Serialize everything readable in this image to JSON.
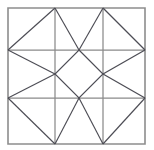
{
  "figure": {
    "name": "quilt-block-geometric-pattern",
    "title": "Ohio Star / Sawtooth quilt block line drawing",
    "background_color": "#ffffff",
    "frame_color": "#8d8d8d",
    "grid_color": "#8a8a8a",
    "diagonal_color": "#4d4d55",
    "canvas": {
      "width": 154,
      "height": 150
    }
  },
  "geometry": {
    "square": {
      "x0": 8,
      "y0": 8,
      "x1": 145,
      "y1": 144
    },
    "vertical_grid_x": [
      55,
      103
    ],
    "horizontal_grid_y": [
      50,
      98
    ],
    "columns": [
      "left",
      "middle",
      "right"
    ],
    "rows": [
      "top",
      "middle",
      "bottom"
    ]
  },
  "chart_data": {
    "type": "diagram",
    "outer_square": {
      "points": "8,8 145,8 145,144 8,144",
      "stroke": "#8d8d8d"
    },
    "grid_lines": [
      {
        "name": "vertical-left",
        "x1": 55,
        "y1": 8,
        "x2": 55,
        "y2": 144
      },
      {
        "name": "vertical-right",
        "x1": 103,
        "y1": 8,
        "x2": 103,
        "y2": 144
      },
      {
        "name": "horizontal-top",
        "x1": 8,
        "y1": 50,
        "x2": 145,
        "y2": 50
      },
      {
        "name": "horizontal-bottom",
        "x1": 8,
        "y1": 98,
        "x2": 145,
        "y2": 98
      }
    ],
    "diagonals": [
      {
        "name": "cell-top-left-diagonal",
        "x1": 8,
        "y1": 50,
        "x2": 55,
        "y2": 8
      },
      {
        "name": "cell-top-middle-left-leg",
        "x1": 55,
        "y1": 8,
        "x2": 79,
        "y2": 50
      },
      {
        "name": "cell-top-middle-right-leg",
        "x1": 103,
        "y1": 8,
        "x2": 79,
        "y2": 50
      },
      {
        "name": "cell-top-right-diagonal",
        "x1": 103,
        "y1": 8,
        "x2": 145,
        "y2": 50
      },
      {
        "name": "cell-middle-left-upper-leg",
        "x1": 8,
        "y1": 50,
        "x2": 55,
        "y2": 74
      },
      {
        "name": "cell-middle-left-lower-leg",
        "x1": 8,
        "y1": 98,
        "x2": 55,
        "y2": 74
      },
      {
        "name": "cell-middle-right-upper-leg",
        "x1": 145,
        "y1": 50,
        "x2": 103,
        "y2": 74
      },
      {
        "name": "cell-middle-right-lower-leg",
        "x1": 145,
        "y1": 98,
        "x2": 103,
        "y2": 74
      },
      {
        "name": "cell-bottom-left-diagonal",
        "x1": 8,
        "y1": 98,
        "x2": 55,
        "y2": 144
      },
      {
        "name": "cell-bottom-middle-left-leg",
        "x1": 79,
        "y1": 98,
        "x2": 55,
        "y2": 144
      },
      {
        "name": "cell-bottom-middle-right-leg",
        "x1": 79,
        "y1": 98,
        "x2": 103,
        "y2": 144
      },
      {
        "name": "cell-bottom-right-diagonal",
        "x1": 103,
        "y1": 144,
        "x2": 145,
        "y2": 98
      }
    ],
    "center_diamond": {
      "name": "center-diamond",
      "points": "79,50 103,74 79,98 55,74"
    }
  }
}
